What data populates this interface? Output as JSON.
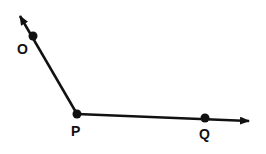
{
  "diagram": {
    "vertex": "P",
    "rays": [
      {
        "from": "P",
        "through": "O",
        "direction": "upper-left"
      },
      {
        "from": "P",
        "through": "Q",
        "direction": "right"
      }
    ],
    "points": [
      {
        "id": "O",
        "label": "O"
      },
      {
        "id": "P",
        "label": "P"
      },
      {
        "id": "Q",
        "label": "Q"
      }
    ],
    "colors": {
      "stroke": "#111111",
      "background": "#ffffff"
    }
  }
}
